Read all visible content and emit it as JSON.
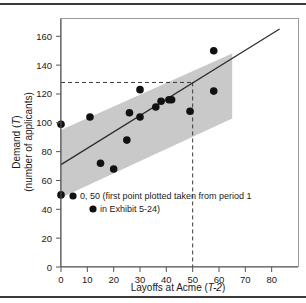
{
  "figure": {
    "background_color": "#ffffff",
    "rule_color": "#3a3a3a",
    "band_color": "#c9c9c9",
    "point_color": "#111111",
    "line_color": "#2b2b2b"
  },
  "chart_data": {
    "type": "scatter",
    "title": "",
    "xlabel": "Layoffs at Acme (T-2)",
    "xlabel_plain": "Layoffs at Acme (",
    "xlabel_italic": "T-2",
    "xlabel_close": ")",
    "ylabel_line1_plain": "Demand (",
    "ylabel_line1_italic": "T",
    "ylabel_line1_close": ")",
    "ylabel_line2": "(number of applicants)",
    "ylabel": "Demand (T) (number of applicants)",
    "xlim": [
      0,
      90
    ],
    "ylim": [
      0,
      172
    ],
    "xticks": [
      0,
      10,
      20,
      30,
      40,
      50,
      60,
      70,
      80
    ],
    "yticks": [
      0,
      20,
      40,
      60,
      80,
      100,
      120,
      140,
      160
    ],
    "xtick_labels": [
      "0",
      "10",
      "20",
      "30",
      "40",
      "50",
      "60",
      "70",
      "80"
    ],
    "ytick_labels": [
      "0",
      "20",
      "40",
      "60",
      "80",
      "100",
      "120",
      "140",
      "160"
    ],
    "grid": false,
    "legend": false,
    "points": [
      {
        "x": 0,
        "y": 99
      },
      {
        "x": 0,
        "y": 50
      },
      {
        "x": 11,
        "y": 104
      },
      {
        "x": 15,
        "y": 72
      },
      {
        "x": 20,
        "y": 68
      },
      {
        "x": 25,
        "y": 88
      },
      {
        "x": 26,
        "y": 107
      },
      {
        "x": 30,
        "y": 104
      },
      {
        "x": 30,
        "y": 123
      },
      {
        "x": 36,
        "y": 111
      },
      {
        "x": 38,
        "y": 115
      },
      {
        "x": 41,
        "y": 116
      },
      {
        "x": 42,
        "y": 116
      },
      {
        "x": 49,
        "y": 108
      },
      {
        "x": 58,
        "y": 150
      },
      {
        "x": 58,
        "y": 122
      }
    ],
    "regression_line": {
      "x_start": 0,
      "y_start": 71,
      "x_end": 83,
      "y_end": 165
    },
    "confidence_band": {
      "x_start": 0,
      "x_end": 65,
      "upper_start": 95,
      "upper_end": 148,
      "lower_start": 48,
      "lower_end": 103
    },
    "reference_lines": {
      "vertical_x": 50,
      "horizontal_y": 128
    },
    "annotations": [
      {
        "text_line1": "0, 50 (first point plotted taken from period 1",
        "text_line2": "in Exhibit 5-24)",
        "marker_line1": "●",
        "marker_line2": "●"
      }
    ]
  }
}
